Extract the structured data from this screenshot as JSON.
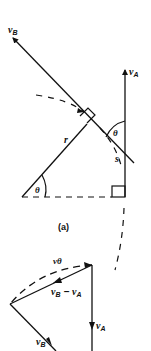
{
  "figure": {
    "caption": "(a)",
    "labels": {
      "vB_top": "v",
      "vB_top_sub": "B",
      "vA_top": "v",
      "vA_top_sub": "A",
      "r": "r",
      "theta_bottom": "θ",
      "theta_top": "θ",
      "s": "s",
      "vtheta": "vθ",
      "diff_v1": "v",
      "diff_sub1": "B",
      "diff_minus": " − ",
      "diff_v2": "v",
      "diff_sub2": "A",
      "vA_bottom": "v",
      "vA_bottom_sub": "A",
      "vB_bottom": "v",
      "vB_bottom_sub": "B"
    },
    "colors": {
      "stroke": "#111111",
      "background": "#ffffff"
    }
  }
}
